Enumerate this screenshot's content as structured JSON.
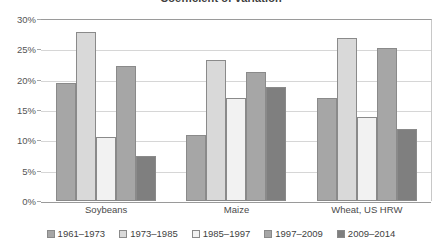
{
  "chart_data": {
    "type": "bar",
    "title": "Coefficient of variation",
    "xlabel": "",
    "ylabel": "",
    "ylim": [
      0,
      30
    ],
    "ytick_labels": [
      "30%",
      "25%",
      "20%",
      "15%",
      "10%",
      "5%",
      "0%"
    ],
    "ytick_values": [
      30,
      25,
      20,
      15,
      10,
      5,
      0
    ],
    "grid": true,
    "legend_position": "bottom",
    "categories": [
      "Soybeans",
      "Maize",
      "Wheat, US HRW"
    ],
    "series": [
      {
        "name": "1961–1973",
        "color": "#a6a6a6",
        "values": [
          19.5,
          10.8,
          17.0
        ]
      },
      {
        "name": "1973–1985",
        "color": "#d9d9d9",
        "values": [
          27.8,
          23.2,
          26.9
        ]
      },
      {
        "name": "1985–1997",
        "color": "#f2f2f2",
        "values": [
          10.5,
          17.0,
          13.8
        ]
      },
      {
        "name": "1997–2009",
        "color": "#a6a6a6",
        "values": [
          22.3,
          21.2,
          25.2
        ]
      },
      {
        "name": "2009–2014",
        "color": "#7f7f7f",
        "values": [
          7.5,
          18.8,
          11.9
        ]
      }
    ]
  },
  "colors": {
    "axis": "#9a9a9a",
    "gridline": "#d6d6d6",
    "text": "#3f3f3f",
    "bar_outline": "#8a8a8a",
    "background": "#ffffff"
  }
}
